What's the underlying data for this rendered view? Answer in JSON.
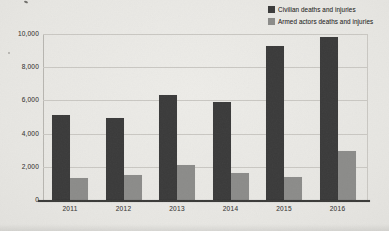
{
  "chart_data": {
    "type": "bar",
    "title": "",
    "xlabel": "",
    "ylabel": "",
    "categories": [
      "2011",
      "2012",
      "2013",
      "2014",
      "2015",
      "2016"
    ],
    "series": [
      {
        "name": "Civilian deaths and injuries",
        "color": "#3a3a3a",
        "values": [
          5100,
          4950,
          6350,
          5900,
          9250,
          9800
        ]
      },
      {
        "name": "Armed actors deaths and injuries",
        "color": "#8b8b89",
        "values": [
          1350,
          1500,
          2100,
          1650,
          1400,
          2950
        ]
      }
    ],
    "ylim": [
      0,
      10000
    ],
    "ytick_interval": 2000,
    "ytick_labels": [
      "0",
      "2,000",
      "4,000",
      "6,000",
      "8,000",
      "10,000"
    ],
    "grid": "horizontal",
    "legend_position": "top-right"
  },
  "colors": {
    "paper": "#e9e8e4",
    "gridline": "#c9c7c2",
    "x_axis": "#3a3a38",
    "tick_text": "#4c4b48",
    "bar_civilian": "#3a3a3a",
    "bar_armed": "#8b8b89"
  }
}
